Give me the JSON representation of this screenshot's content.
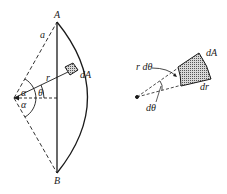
{
  "diagram": {
    "left_figure": {
      "labels": {
        "A": "A",
        "B": "B",
        "a": "a",
        "r": "r",
        "dA": "dA",
        "theta": "θ",
        "alpha_top": "α",
        "alpha_bottom": "α"
      }
    },
    "right_figure": {
      "labels": {
        "r_dtheta": "r dθ",
        "dA": "dA",
        "dr": "dr",
        "dtheta": "dθ"
      }
    },
    "colors": {
      "stroke": "#1a1a1a",
      "element_fill": "#9a9a9a",
      "background": "#ffffff"
    }
  }
}
